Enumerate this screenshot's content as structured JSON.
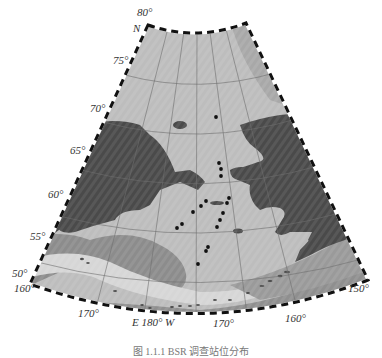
{
  "map": {
    "projection": "conic (Bering Sea / Chukchi Sea region)",
    "colors": {
      "land": "#4a4a4a",
      "shelf_sea": "#bdbdbd",
      "deep_sea": "#8c8c8c",
      "slope_band": "#d2d2d2",
      "graticule": "#6e6e6e",
      "station": "#111111",
      "frame_dark": "#111111",
      "frame_light": "#ffffff"
    },
    "lat_labels": [
      {
        "text": "80°",
        "x": 137,
        "y": 14
      },
      {
        "text": "N",
        "x": 133,
        "y": 30
      },
      {
        "text": "75°",
        "x": 113,
        "y": 62
      },
      {
        "text": "70°",
        "x": 90,
        "y": 110
      },
      {
        "text": "65°",
        "x": 70,
        "y": 152
      },
      {
        "text": "60°",
        "x": 48,
        "y": 196
      },
      {
        "text": "55°",
        "x": 30,
        "y": 238
      },
      {
        "text": "50°",
        "x": 12,
        "y": 275
      }
    ],
    "lon_labels": [
      {
        "text": "160°",
        "x": 14,
        "y": 290
      },
      {
        "text": "170°",
        "x": 78,
        "y": 315
      },
      {
        "text": "E 180° W",
        "x": 132,
        "y": 324
      },
      {
        "text": "170°",
        "x": 213,
        "y": 325
      },
      {
        "text": "160°",
        "x": 285,
        "y": 320
      },
      {
        "text": "150°",
        "x": 348,
        "y": 290
      }
    ],
    "stations": [
      {
        "x": 216,
        "y": 117
      },
      {
        "x": 219,
        "y": 163
      },
      {
        "x": 221,
        "y": 169
      },
      {
        "x": 221,
        "y": 176
      },
      {
        "x": 206,
        "y": 201
      },
      {
        "x": 229,
        "y": 198
      },
      {
        "x": 227,
        "y": 203
      },
      {
        "x": 201,
        "y": 206
      },
      {
        "x": 223,
        "y": 213
      },
      {
        "x": 193,
        "y": 212
      },
      {
        "x": 220,
        "y": 220
      },
      {
        "x": 182,
        "y": 224
      },
      {
        "x": 177,
        "y": 228
      },
      {
        "x": 217,
        "y": 227
      },
      {
        "x": 208,
        "y": 247
      },
      {
        "x": 206,
        "y": 251
      },
      {
        "x": 198,
        "y": 264
      }
    ]
  },
  "caption": "图 1.1.1   BSR 调查站位分布"
}
